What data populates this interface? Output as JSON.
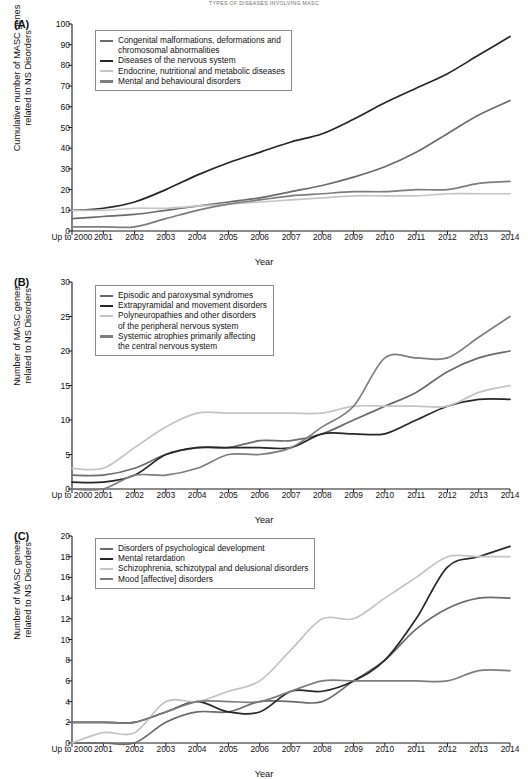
{
  "running_head": "Types of Diseases Involving MASC",
  "xlabel": "Year",
  "x_categories": [
    "Up to\n2000",
    "2001",
    "2002",
    "2003",
    "2004",
    "2005",
    "2006",
    "2007",
    "2008",
    "2009",
    "2010",
    "2011",
    "2012",
    "2013",
    "2014"
  ],
  "colors": {
    "dark": "#2b2b2b",
    "mid_dark": "#5a5a5a",
    "mid": "#757575",
    "light": "#bdbdbd",
    "axis": "#1a1a1a",
    "legend_border": "#8c8c8c",
    "background": "#ffffff"
  },
  "panels": [
    {
      "letter": "(A)",
      "ylabel": "Cumulative number of MASC genes\nrelated to NS Disorders",
      "yticks": [
        0,
        10,
        20,
        30,
        40,
        50,
        60,
        70,
        80,
        90,
        100
      ]
    },
    {
      "letter": "(B)",
      "ylabel": "Number of MASC genes\nrelated to NS Disorders",
      "yticks": [
        0,
        5,
        10,
        15,
        20,
        25,
        30
      ]
    },
    {
      "letter": "(C)",
      "ylabel": "Number of MASC genes\nrelated to NS Disorders",
      "yticks": [
        0,
        2,
        4,
        6,
        8,
        10,
        12,
        14,
        16,
        18,
        20
      ]
    }
  ],
  "chart_data": [
    {
      "type": "line",
      "panel": "(A)",
      "title": "",
      "xlabel": "Year",
      "ylabel": "Cumulative number of MASC genes related to NS Disorders",
      "x": [
        "Up to 2000",
        "2001",
        "2002",
        "2003",
        "2004",
        "2005",
        "2006",
        "2007",
        "2008",
        "2009",
        "2010",
        "2011",
        "2012",
        "2013",
        "2014"
      ],
      "ylim": [
        0,
        100
      ],
      "ytick_step": 10,
      "grid": false,
      "legend_position": "top-left",
      "series": [
        {
          "name": "Congenital malformations, deformations and chromosomal abnormalities",
          "color": "#6b6b6b",
          "values": [
            6,
            7,
            8,
            10,
            12,
            14,
            16,
            19,
            22,
            26,
            31,
            38,
            47,
            56,
            63
          ]
        },
        {
          "name": "Diseases of the nervous system",
          "color": "#262626",
          "values": [
            10,
            11,
            14,
            20,
            27,
            33,
            38,
            43,
            47,
            54,
            62,
            69,
            76,
            85,
            94
          ]
        },
        {
          "name": "Endocrine, nutritional and metabolic diseases",
          "color": "#c4c4c4",
          "values": [
            10,
            10,
            11,
            11,
            12,
            13,
            14,
            15,
            16,
            17,
            17,
            17,
            18,
            18,
            18
          ]
        },
        {
          "name": "Mental and behavioural disorders",
          "color": "#7d7d7d",
          "values": [
            2,
            2,
            2,
            6,
            10,
            13,
            15,
            17,
            18,
            19,
            19,
            20,
            20,
            23,
            24
          ]
        }
      ]
    },
    {
      "type": "line",
      "panel": "(B)",
      "title": "",
      "xlabel": "Year",
      "ylabel": "Number of MASC genes related to NS Disorders",
      "x": [
        "Up to 2000",
        "2001",
        "2002",
        "2003",
        "2004",
        "2005",
        "2006",
        "2007",
        "2008",
        "2009",
        "2010",
        "2011",
        "2012",
        "2013",
        "2014"
      ],
      "ylim": [
        0,
        30
      ],
      "ytick_step": 5,
      "grid": false,
      "legend_position": "top-left",
      "series": [
        {
          "name": "Episodic and paroxysmal syndromes",
          "color": "#6b6b6b",
          "values": [
            2,
            2,
            3,
            5,
            6,
            6,
            7,
            7,
            8,
            10,
            12,
            14,
            17,
            19,
            20
          ]
        },
        {
          "name": "Extrapyramidal and movement disorders",
          "color": "#262626",
          "values": [
            1,
            1,
            2,
            5,
            6,
            6,
            6,
            6,
            8,
            8,
            8,
            10,
            12,
            13,
            13
          ]
        },
        {
          "name": "Polyneuropathies and other disorders of the peripheral nervous system",
          "color": "#c4c4c4",
          "values": [
            3,
            3,
            6,
            9,
            11,
            11,
            11,
            11,
            11,
            12,
            12,
            12,
            12,
            14,
            15
          ]
        },
        {
          "name": "Systemic atrophies primarily affecting the central nervous system",
          "color": "#7d7d7d",
          "values": [
            0,
            0,
            2,
            2,
            3,
            5,
            5,
            6,
            9,
            12,
            19,
            19,
            19,
            22,
            25
          ]
        }
      ]
    },
    {
      "type": "line",
      "panel": "(C)",
      "title": "",
      "xlabel": "Year",
      "ylabel": "Number of MASC genes related to NS Disorders",
      "x": [
        "Up to 2000",
        "2001",
        "2002",
        "2003",
        "2004",
        "2005",
        "2006",
        "2007",
        "2008",
        "2009",
        "2010",
        "2011",
        "2012",
        "2013",
        "2014"
      ],
      "ylim": [
        0,
        20
      ],
      "ytick_step": 2,
      "grid": false,
      "legend_position": "top-left",
      "series": [
        {
          "name": "Disorders of psychological development",
          "color": "#6b6b6b",
          "values": [
            0,
            0,
            0,
            2,
            3,
            3,
            4,
            4,
            4,
            6,
            8,
            11,
            13,
            14,
            14
          ]
        },
        {
          "name": "Mental retardation",
          "color": "#262626",
          "values": [
            2,
            2,
            2,
            3,
            4,
            3,
            3,
            5,
            5,
            6,
            8,
            12,
            17,
            18,
            19
          ]
        },
        {
          "name": "Schizophrenia, schizotypal and delusional disorders",
          "color": "#c4c4c4",
          "values": [
            0,
            1,
            1,
            4,
            4,
            5,
            6,
            9,
            12,
            12,
            14,
            16,
            18,
            18,
            18
          ]
        },
        {
          "name": "Mood [affective] disorders",
          "color": "#7d7d7d",
          "values": [
            2,
            2,
            2,
            3,
            4,
            4,
            4,
            5,
            6,
            6,
            6,
            6,
            6,
            7,
            7
          ]
        }
      ]
    }
  ]
}
